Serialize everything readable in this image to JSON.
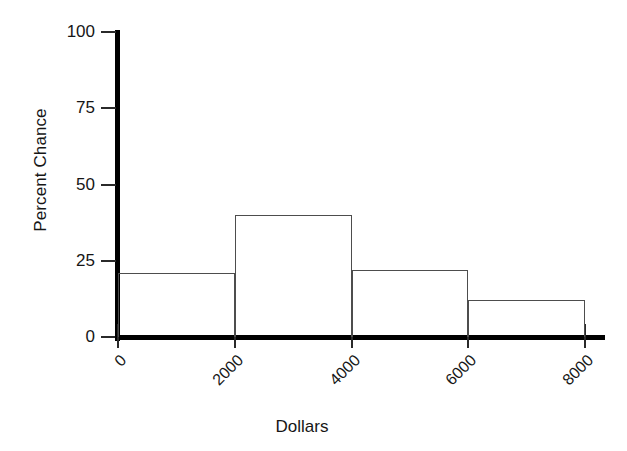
{
  "chart_data": {
    "type": "bar",
    "title": "",
    "subtitle": "",
    "xlabel": "Dollars",
    "ylabel": "Percent Chance",
    "categories": [
      "0-2000",
      "2000-4000",
      "4000-6000",
      "6000-8000"
    ],
    "bin_edges": [
      0,
      2000,
      4000,
      6000,
      8000
    ],
    "values": [
      21,
      40,
      22,
      12
    ],
    "series": [
      {
        "name": "Percent Chance",
        "values": [
          21,
          40,
          22,
          12
        ]
      }
    ],
    "xlim": [
      0,
      8000
    ],
    "ylim": [
      0,
      100
    ],
    "x_tick_labels": [
      "0",
      "2000",
      "4000",
      "6000",
      "8000"
    ],
    "x_tick_values": [
      0,
      2000,
      4000,
      6000,
      8000
    ],
    "y_tick_labels": [
      "0",
      "25",
      "50",
      "75",
      "100"
    ],
    "y_tick_values": [
      0,
      25,
      50,
      75,
      100
    ],
    "grid": false,
    "legend": "none",
    "x_tick_label_rotation": -45,
    "style": {
      "background": "#ffffff",
      "axis_color": "#000000",
      "bar_outline_color": "#4d4d4d",
      "bar_fill": "none",
      "text_color": "#161616"
    },
    "annotations": []
  },
  "axes": {
    "y_title": "Percent Chance",
    "x_title": "Dollars",
    "y_ticks": [
      {
        "label": "100",
        "value": 100
      },
      {
        "label": "75",
        "value": 75
      },
      {
        "label": "50",
        "value": 50
      },
      {
        "label": "25",
        "value": 25
      },
      {
        "label": "0",
        "value": 0
      }
    ],
    "x_ticks": [
      {
        "label": "0",
        "value": 0
      },
      {
        "label": "2000",
        "value": 2000
      },
      {
        "label": "4000",
        "value": 4000
      },
      {
        "label": "6000",
        "value": 6000
      },
      {
        "label": "8000",
        "value": 8000
      }
    ]
  },
  "bars": [
    {
      "label": "0-2000",
      "value": 21
    },
    {
      "label": "2000-4000",
      "value": 40
    },
    {
      "label": "4000-6000",
      "value": 22
    },
    {
      "label": "6000-8000",
      "value": 12
    }
  ]
}
